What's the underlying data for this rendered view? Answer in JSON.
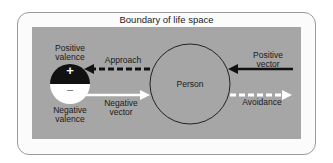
{
  "diagram": {
    "boundary_label": "Boundary of life space",
    "person_label": "Person",
    "valence": {
      "positive_label_line1": "Positive",
      "positive_label_line2": "valence",
      "negative_label_line1": "Negative",
      "negative_label_line2": "valence",
      "positive_symbol": "+",
      "negative_symbol": "–"
    },
    "arrows": {
      "approach": "Approach",
      "negative_vector_line1": "Negative",
      "negative_vector_line2": "vector",
      "positive_vector_line1": "Positive",
      "positive_vector_line2": "vector",
      "avoidance": "Avoidance"
    },
    "colors": {
      "field": "#a6a6a6",
      "positive": "#111111",
      "negative": "#ffffff",
      "outline": "#222222"
    }
  }
}
